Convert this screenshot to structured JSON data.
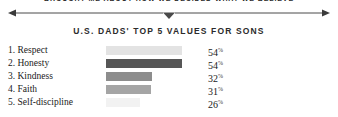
{
  "top_clipped_text": "BROUGHT ME ABOUT HOW WE DECIDED WHAT WE BELIEVE",
  "headline": "U.S. DADS' TOP 5 VALUES FOR SONS",
  "divider": {
    "left_arrow_icon": "arrow-left-icon",
    "right_arrow_icon": "arrow-right-icon",
    "center_notch_icon": "chevron-down-notch-icon"
  },
  "percent_symbol": "%",
  "chart_data": {
    "type": "bar",
    "title": "U.S. DADS' TOP 5 VALUES FOR SONS",
    "xlabel": "",
    "ylabel": "",
    "orientation": "horizontal",
    "grid": false,
    "legend": false,
    "xlim": [
      0,
      60
    ],
    "categories": [
      "1. Respect",
      "2. Honesty",
      "3. Kindness",
      "4. Faith",
      "5. Self-discipline"
    ],
    "values": [
      54,
      54,
      32,
      31,
      26
    ],
    "value_labels": [
      "54",
      "54",
      "32",
      "31",
      "26"
    ],
    "bar_colors": [
      "#e3e3e3",
      "#565656",
      "#8d8d8d",
      "#a5a5a5",
      "#f2f2f2"
    ],
    "bar_widths_px": [
      76,
      76,
      46,
      45,
      34
    ],
    "rows": [
      {
        "rank": "1.",
        "label": "1. Respect",
        "value": "54",
        "width_px": 76,
        "color": "#e3e3e3"
      },
      {
        "rank": "2.",
        "label": "2. Honesty",
        "value": "54",
        "width_px": 76,
        "color": "#565656"
      },
      {
        "rank": "3.",
        "label": "3. Kindness",
        "value": "32",
        "width_px": 46,
        "color": "#8d8d8d"
      },
      {
        "rank": "4.",
        "label": "4. Faith",
        "value": "31",
        "width_px": 45,
        "color": "#a5a5a5"
      },
      {
        "rank": "5.",
        "label": "5. Self-discipline",
        "value": "26",
        "width_px": 34,
        "color": "#f2f2f2"
      }
    ]
  },
  "colors": {
    "background": "#ffffff",
    "text": "#1a1a1a",
    "rule": "#4a4a4a"
  }
}
